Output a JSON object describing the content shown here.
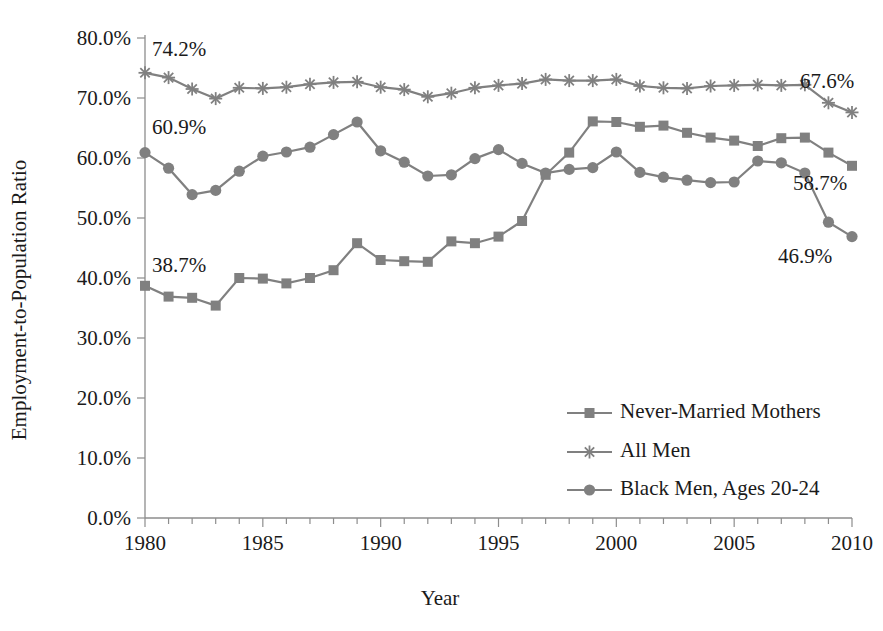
{
  "chart_data": {
    "type": "line",
    "title": "",
    "xlabel": "Year",
    "ylabel": "Employment-to-Population Ratio",
    "xlim": [
      1980,
      2010
    ],
    "ylim": [
      0,
      80
    ],
    "grid": false,
    "legend_position": "inside-lower-right",
    "x_tick_labels": [
      "1980",
      "1985",
      "1990",
      "1995",
      "2000",
      "2005",
      "2010"
    ],
    "x_tick_values": [
      1980,
      1985,
      1990,
      1995,
      2000,
      2005,
      2010
    ],
    "x_minor_tick_step": 1,
    "y_tick_labels": [
      "0.0%",
      "10.0%",
      "20.0%",
      "30.0%",
      "40.0%",
      "50.0%",
      "60.0%",
      "70.0%",
      "80.0%"
    ],
    "y_tick_values": [
      0,
      10,
      20,
      30,
      40,
      50,
      60,
      70,
      80
    ],
    "x": [
      1980,
      1981,
      1982,
      1983,
      1984,
      1985,
      1986,
      1987,
      1988,
      1989,
      1990,
      1991,
      1992,
      1993,
      1994,
      1995,
      1996,
      1997,
      1998,
      1999,
      2000,
      2001,
      2002,
      2003,
      2004,
      2005,
      2006,
      2007,
      2008,
      2009,
      2010
    ],
    "series": [
      {
        "name": "Never-Married Mothers",
        "marker": "square",
        "color": "#808080",
        "values": [
          38.7,
          36.9,
          36.7,
          35.4,
          40.0,
          39.9,
          39.1,
          40.0,
          41.3,
          45.8,
          43.0,
          42.8,
          42.7,
          46.1,
          45.8,
          46.9,
          49.5,
          57.2,
          60.9,
          66.1,
          66.0,
          65.2,
          65.4,
          64.2,
          63.4,
          62.9,
          62.0,
          63.3,
          63.4,
          60.9,
          58.7
        ]
      },
      {
        "name": "All Men",
        "marker": "star",
        "color": "#808080",
        "values": [
          74.2,
          73.4,
          71.5,
          69.9,
          71.7,
          71.6,
          71.8,
          72.3,
          72.6,
          72.7,
          71.8,
          71.4,
          70.2,
          70.8,
          71.7,
          72.1,
          72.4,
          73.1,
          72.9,
          72.9,
          73.1,
          72.0,
          71.7,
          71.6,
          72.0,
          72.1,
          72.2,
          72.1,
          72.2,
          69.2,
          67.6
        ]
      },
      {
        "name": "Black Men, Ages 20-24",
        "marker": "circle",
        "color": "#808080",
        "values": [
          60.9,
          58.3,
          53.9,
          54.6,
          57.8,
          60.3,
          61.0,
          61.8,
          63.9,
          66.0,
          61.2,
          59.3,
          57.0,
          57.2,
          59.9,
          61.4,
          59.1,
          57.5,
          58.1,
          58.4,
          61.0,
          57.6,
          56.8,
          56.3,
          55.9,
          56.0,
          59.5,
          59.2,
          57.5,
          49.3,
          46.9
        ]
      }
    ],
    "annotations": [
      {
        "text": "74.2%",
        "series": "All Men",
        "year": 1980,
        "value": 74.2
      },
      {
        "text": "60.9%",
        "series": "Black Men, Ages 20-24",
        "year": 1980,
        "value": 60.9
      },
      {
        "text": "38.7%",
        "series": "Never-Married Mothers",
        "year": 1980,
        "value": 38.7
      },
      {
        "text": "67.6%",
        "series": "All Men",
        "year": 2010,
        "value": 67.6
      },
      {
        "text": "58.7%",
        "series": "Never-Married Mothers",
        "year": 2010,
        "value": 58.7
      },
      {
        "text": "46.9%",
        "series": "Black Men, Ages 20-24",
        "year": 2010,
        "value": 46.9
      }
    ]
  }
}
